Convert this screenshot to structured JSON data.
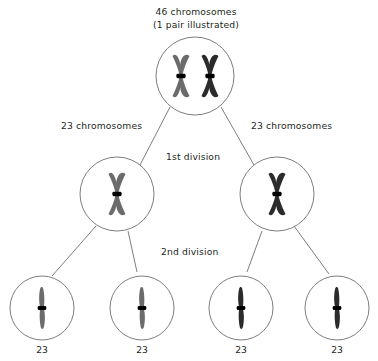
{
  "diagram": {
    "title_lines": [
      "46 chromosomes",
      "(1 pair illustrated)"
    ],
    "title_line1": "46 chromosomes",
    "title_line2": "(1 pair illustrated)",
    "stage_labels": {
      "first_division": "1st division",
      "second_division": "2nd division"
    },
    "side_labels": {
      "left": "23 chromosomes",
      "right": "23 chromosomes"
    },
    "colors": {
      "background": "#ffffff",
      "outline": "#6e6e6e",
      "text": "#231f20",
      "chromosome_light": "#6b6b6b",
      "chromosome_dark": "#2b2b2b",
      "centromere": "#000000"
    },
    "cells": {
      "parent": {
        "label": "46 chromosomes",
        "chromosome_count": 2,
        "chromosomes": [
          {
            "shade": "light",
            "form": "x-shaped"
          },
          {
            "shade": "dark",
            "form": "x-shaped"
          }
        ]
      },
      "first_division_row": [
        {
          "label": "23 chromosomes",
          "chromosome_count": 1,
          "chromosomes": [
            {
              "shade": "light",
              "form": "x-shaped"
            }
          ]
        },
        {
          "label": "23 chromosomes",
          "chromosome_count": 1,
          "chromosomes": [
            {
              "shade": "dark",
              "form": "x-shaped"
            }
          ]
        }
      ],
      "second_division_row": [
        {
          "label": "23",
          "chromosome_count": 1,
          "chromosomes": [
            {
              "shade": "light",
              "form": "rod"
            }
          ]
        },
        {
          "label": "23",
          "chromosome_count": 1,
          "chromosomes": [
            {
              "shade": "light",
              "form": "rod"
            }
          ]
        },
        {
          "label": "23",
          "chromosome_count": 1,
          "chromosomes": [
            {
              "shade": "dark",
              "form": "rod"
            }
          ]
        },
        {
          "label": "23",
          "chromosome_count": 1,
          "chromosomes": [
            {
              "shade": "dark",
              "form": "rod"
            }
          ]
        }
      ]
    },
    "gamete_labels": [
      "23",
      "23",
      "23",
      "23"
    ]
  }
}
